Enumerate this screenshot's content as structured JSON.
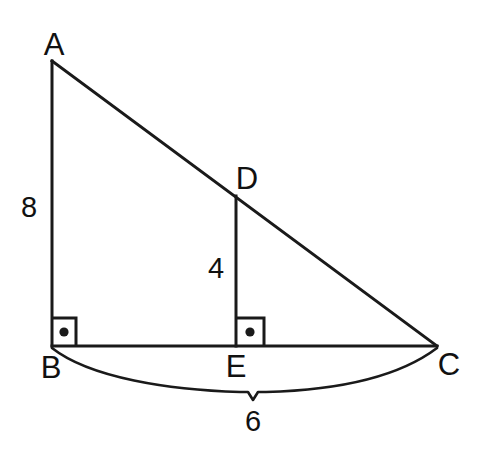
{
  "figure": {
    "background_color": "#ffffff",
    "stroke_color": "#1a1a1a",
    "text_color": "#111111",
    "vertices": [
      {
        "name": "A",
        "label": "A",
        "x": 52,
        "y": 61,
        "label_x": 54,
        "label_y": 44
      },
      {
        "name": "B",
        "label": "B",
        "x": 52,
        "y": 346,
        "label_x": 51,
        "label_y": 367
      },
      {
        "name": "C",
        "label": "C",
        "x": 437,
        "y": 346,
        "label_x": 449,
        "label_y": 364
      },
      {
        "name": "D",
        "label": "D",
        "x": 236,
        "y": 196,
        "label_x": 247,
        "label_y": 178
      },
      {
        "name": "E",
        "label": "E",
        "x": 236,
        "y": 346,
        "label_x": 236,
        "label_y": 366
      }
    ],
    "segments": [
      {
        "name": "AB",
        "from": "A",
        "to": "B",
        "style": "solid"
      },
      {
        "name": "AC",
        "from": "A",
        "to": "C",
        "style": "solid"
      },
      {
        "name": "BC",
        "from": "B",
        "to": "C",
        "style": "solid"
      },
      {
        "name": "DE",
        "from": "D",
        "to": "E",
        "style": "solid"
      }
    ],
    "right_angles": [
      {
        "name": "angle-B",
        "at": "B",
        "marker": "square-with-dot",
        "x": 53,
        "y": 318,
        "size": 23
      },
      {
        "name": "angle-E",
        "at": "E",
        "marker": "square-with-dot",
        "x": 237,
        "y": 318,
        "size": 27
      }
    ],
    "measures": [
      {
        "name": "AB",
        "value": "8",
        "x": 29,
        "y": 207,
        "for": "side-ab"
      },
      {
        "name": "DE",
        "value": "4",
        "x": 216,
        "y": 268,
        "for": "segment-de"
      },
      {
        "name": "BC",
        "value": "6",
        "x": 253,
        "y": 421,
        "for": "side-bc"
      }
    ],
    "brace": {
      "name": "brace-bc",
      "from_x": 52,
      "to_x": 437,
      "top_y": 348,
      "mid_x": 253,
      "tip_y": 400
    }
  }
}
